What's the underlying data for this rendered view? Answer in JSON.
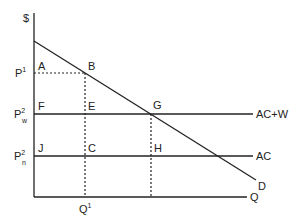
{
  "diagram": {
    "type": "economics-supply-demand",
    "colors": {
      "line": "#222222",
      "background": "#ffffff"
    },
    "axes": {
      "y_label": "$",
      "x_label": "Q"
    },
    "price_labels": {
      "p1": {
        "base": "P",
        "sup": "1"
      },
      "pw2": {
        "base": "P",
        "sup": "2",
        "sub": "w"
      },
      "pn2": {
        "base": "P",
        "sup": "2",
        "sub": "n"
      }
    },
    "quantity_labels": {
      "q1": {
        "base": "Q",
        "sup": "1"
      }
    },
    "curves": {
      "demand": "D",
      "ac_plus_w": "AC+W",
      "ac": "AC"
    },
    "points": {
      "A": "A",
      "B": "B",
      "E": "E",
      "F": "F",
      "G": "G",
      "H": "H",
      "J": "J",
      "C": "C"
    }
  }
}
